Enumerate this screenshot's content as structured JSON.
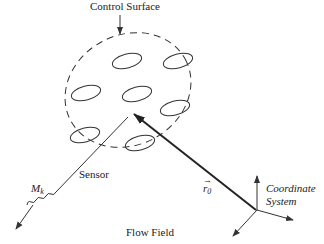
{
  "labels": {
    "control_surface": "Control Surface",
    "sensor": "Sensor",
    "mk_main": "M",
    "mk_sub": "k",
    "r0_main": "r",
    "r0_sub": "0",
    "coord_line1": "Coordinate",
    "coord_line2": "System",
    "flow_field": "Flow Field"
  },
  "colors": {
    "stroke": "#333333",
    "text": "#222222",
    "background": "#ffffff"
  }
}
